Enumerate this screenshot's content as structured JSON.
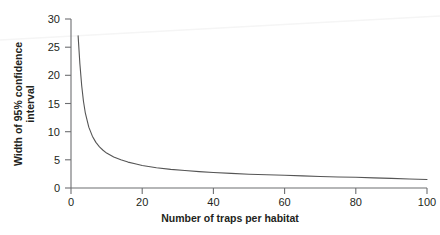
{
  "chart_data": {
    "type": "line",
    "title": "",
    "subtitle": "",
    "xlabel": "Number of traps per habitat",
    "ylabel": "Width of 95% confidence interval",
    "ylabel_line1": "Width of 95% confidence",
    "ylabel_line2": "interval",
    "xlim": [
      0,
      100
    ],
    "ylim": [
      0,
      30
    ],
    "xticks": [
      0,
      20,
      40,
      60,
      80,
      100
    ],
    "yticks": [
      0,
      5,
      10,
      15,
      20,
      25,
      30
    ],
    "xtick_labels": [
      "0",
      "20",
      "40",
      "60",
      "80",
      "100"
    ],
    "ytick_labels": [
      "0",
      "5",
      "10",
      "15",
      "20",
      "25",
      "30"
    ],
    "grid": false,
    "legend": false,
    "legend_position": "none",
    "line_color": "#555555",
    "axis_color": "#6d6e71",
    "text_color": "#231f20",
    "background_color": "#ffffff",
    "series": [
      {
        "name": "Width of 95% confidence interval",
        "x": [
          2,
          2.5,
          3,
          3.5,
          4,
          5,
          6,
          7,
          8,
          9,
          10,
          12,
          14,
          16,
          18,
          20,
          24,
          28,
          32,
          36,
          40,
          45,
          50,
          55,
          60,
          65,
          70,
          75,
          80,
          85,
          90,
          95,
          100
        ],
        "values": [
          27.0,
          22.0,
          18.2,
          15.4,
          13.4,
          10.8,
          9.2,
          8.1,
          7.3,
          6.7,
          6.2,
          5.5,
          5.0,
          4.6,
          4.3,
          4.0,
          3.6,
          3.3,
          3.1,
          2.9,
          2.75,
          2.6,
          2.45,
          2.35,
          2.25,
          2.15,
          2.05,
          1.95,
          1.9,
          1.8,
          1.7,
          1.6,
          1.5
        ]
      }
    ],
    "annotations": [
      {
        "name": "scan-artifact-line",
        "description": "faint diagonal scan streak across upper plot area",
        "color": "#f4f4f4"
      }
    ]
  }
}
